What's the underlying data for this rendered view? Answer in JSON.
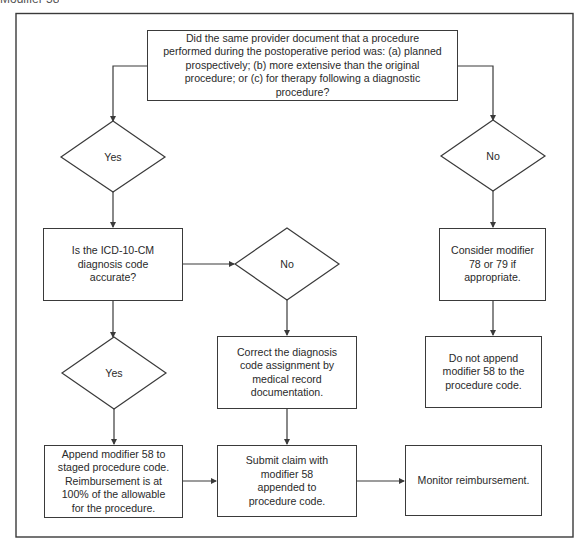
{
  "header_fragment": "Modifier 58",
  "flowchart": {
    "question": "Did the same provider document that a procedure performed during the postoperative period was:  (a) planned prospectively; (b) more extensive than the original procedure; or (c) for therapy following a diagnostic procedure?",
    "decision_yes_1": "Yes",
    "decision_no_right": "No",
    "icd_question": "Is the ICD-10-CM diagnosis code accurate?",
    "decision_no_middle": "No",
    "decision_yes_2": "Yes",
    "correct_code": "Correct the diagnosis code assignment by medical record documentation.",
    "consider_modifier": "Consider modifier 78 or 79 if appropriate.",
    "do_not_append": "Do not append modifier 58 to the procedure code.",
    "append_modifier": "Append modifier 58 to staged procedure code. Reimbursement is at 100% of the allowable for the procedure.",
    "submit_claim": "Submit claim with modifier 58 appended to procedure code.",
    "monitor": "Monitor reimbursement."
  },
  "colors": {
    "line": "#3a3a3a",
    "background": "#ffffff",
    "text": "#2a2a2a"
  }
}
